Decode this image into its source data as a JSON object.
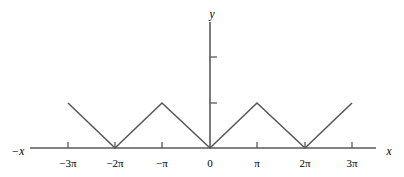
{
  "figure": {
    "background_color": "#ffffff",
    "line_color": "#58585a",
    "text_color": "#2b2b2b"
  },
  "axes": {
    "x_axis": {
      "label_right": "x",
      "label_left": "−x",
      "left_end_px": 30,
      "right_end_px": 376,
      "baseline_y_px": 148
    },
    "y_axis": {
      "label_top": "y",
      "top_end_px": 22,
      "x_px": 210
    },
    "x_ticks": [
      {
        "label": "−3",
        "pi": "π",
        "full": "−3π",
        "x_px": 68,
        "value": -9.4248
      },
      {
        "label": "−2",
        "pi": "π",
        "full": "−2π",
        "x_px": 115,
        "value": -6.2832
      },
      {
        "label": "−",
        "pi": "π",
        "full": "−π",
        "x_px": 162,
        "value": -3.1416
      },
      {
        "label": "0",
        "pi": "",
        "full": "0",
        "x_px": 210,
        "value": 0
      },
      {
        "label": "",
        "pi": "π",
        "full": "π",
        "x_px": 257,
        "value": 3.1416
      },
      {
        "label": "2",
        "pi": "π",
        "full": "2π",
        "x_px": 305,
        "value": 6.2832
      },
      {
        "label": "3",
        "pi": "π",
        "full": "3π",
        "x_px": 352,
        "value": 9.4248
      }
    ],
    "y_ticks": [
      {
        "label": "",
        "y_px": 57,
        "value": 2
      },
      {
        "label": "",
        "y_px": 103,
        "value": 1
      }
    ]
  },
  "chart_data": {
    "type": "line",
    "title": "",
    "subtitle": "",
    "xlabel": "x",
    "ylabel": "y",
    "grid": false,
    "legend": null,
    "legend_position": "none",
    "xlim": [
      -9.4248,
      9.4248
    ],
    "ylim": [
      0,
      2.2
    ],
    "x_tick_labels": [
      "−3π",
      "−2π",
      "−π",
      "0",
      "π",
      "2π",
      "3π"
    ],
    "x_tick_values": [
      -9.4248,
      -6.2832,
      -3.1416,
      0,
      3.1416,
      6.2832,
      9.4248
    ],
    "y_tick_values": [
      1,
      2
    ],
    "y_tick_labels": [
      "",
      ""
    ],
    "series": [
      {
        "name": "triangle wave",
        "color": "#58585a",
        "x": [
          -9.4248,
          -6.2832,
          -3.1416,
          0,
          3.1416,
          6.2832,
          9.4248
        ],
        "y": [
          1,
          0,
          1,
          0,
          1,
          0,
          1
        ]
      }
    ],
    "points_px": [
      {
        "x": 68,
        "y": 103
      },
      {
        "x": 115,
        "y": 148
      },
      {
        "x": 162,
        "y": 103
      },
      {
        "x": 210,
        "y": 148
      },
      {
        "x": 257,
        "y": 103
      },
      {
        "x": 305,
        "y": 148
      },
      {
        "x": 352,
        "y": 103
      }
    ],
    "annotations": []
  }
}
